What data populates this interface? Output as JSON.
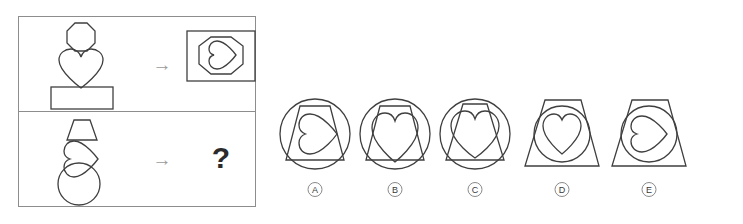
{
  "puzzle": {
    "type": "abstract-reasoning-matrix",
    "stroke_color": "#3f3f3f",
    "frame_color": "#8d8d8d",
    "arrow_color": "#9a9a9a",
    "question_mark": "?",
    "arrow_glyph": "→",
    "rows": [
      {
        "id": "example-row",
        "name": "example",
        "source_shapes": [
          "octagon",
          "heart",
          "rectangle"
        ],
        "arrow": "→",
        "result": {
          "outer": "rectangle",
          "middle": "octagon",
          "inner": "heart",
          "inner_rotation_deg": 90,
          "description": "rectangle containing octagon containing sideways heart"
        }
      },
      {
        "id": "question-row",
        "name": "question",
        "source_shapes": [
          "trapezoid",
          "heart-rotated",
          "circle"
        ],
        "arrow": "→",
        "result": {
          "outer": "unknown",
          "middle": "unknown",
          "inner": "unknown",
          "description": "unknown answer marked by question mark"
        }
      }
    ]
  },
  "options": [
    {
      "label": "A",
      "outer": "circle",
      "middle": "trapezoid",
      "inner": "heart",
      "inner_rotation_deg": 90,
      "description": "circle containing trapezoid containing sideways heart"
    },
    {
      "label": "B",
      "outer": "circle",
      "middle": "trapezoid",
      "inner": "heart",
      "inner_rotation_deg": 0,
      "description": "circle containing trapezoid containing upright heart"
    },
    {
      "label": "C",
      "outer": "circle",
      "middle": "trapezoid",
      "inner": "heart",
      "inner_rotation_deg": 0,
      "description": "circle containing narrow trapezoid containing wide upright heart"
    },
    {
      "label": "D",
      "outer": "trapezoid",
      "middle": "circle",
      "inner": "heart",
      "inner_rotation_deg": 0,
      "description": "trapezoid containing circle containing upright heart"
    },
    {
      "label": "E",
      "outer": "trapezoid",
      "middle": "circle",
      "inner": "heart",
      "inner_rotation_deg": 90,
      "description": "trapezoid containing circle containing sideways heart"
    }
  ]
}
